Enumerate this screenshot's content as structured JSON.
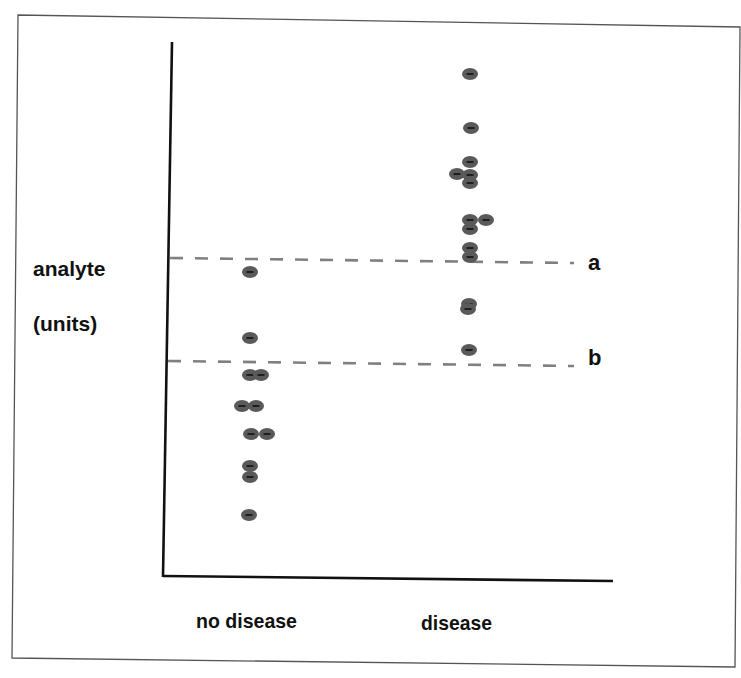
{
  "chart_data": {
    "type": "scatter",
    "title": "",
    "ylabel": [
      "analyte",
      "(units)"
    ],
    "xlabel": "",
    "categories": [
      "no disease",
      "disease"
    ],
    "series": [
      {
        "name": "no disease",
        "points": [
          {
            "x": 250,
            "y": 272
          },
          {
            "x": 250,
            "y": 338
          },
          {
            "x": 250,
            "y": 375
          },
          {
            "x": 261,
            "y": 375
          },
          {
            "x": 242,
            "y": 406
          },
          {
            "x": 256,
            "y": 406
          },
          {
            "x": 251,
            "y": 434
          },
          {
            "x": 267,
            "y": 434
          },
          {
            "x": 250,
            "y": 466
          },
          {
            "x": 250,
            "y": 477
          },
          {
            "x": 249,
            "y": 515
          }
        ]
      },
      {
        "name": "disease",
        "points": [
          {
            "x": 470,
            "y": 74
          },
          {
            "x": 471,
            "y": 128
          },
          {
            "x": 470,
            "y": 162
          },
          {
            "x": 457,
            "y": 174
          },
          {
            "x": 470,
            "y": 175
          },
          {
            "x": 470,
            "y": 183
          },
          {
            "x": 470,
            "y": 220
          },
          {
            "x": 486,
            "y": 220
          },
          {
            "x": 470,
            "y": 229
          },
          {
            "x": 470,
            "y": 248
          },
          {
            "x": 470,
            "y": 257
          },
          {
            "x": 469,
            "y": 304
          },
          {
            "x": 468,
            "y": 309
          },
          {
            "x": 469,
            "y": 350
          }
        ]
      }
    ],
    "thresholds": [
      {
        "label": "a",
        "y_start": 258,
        "y_end": 263
      },
      {
        "label": "b",
        "y_start": 361,
        "y_end": 366
      }
    ],
    "axis_ticks": "none",
    "grid": false,
    "legend": "none",
    "colors": {
      "dot": "#5a5a5a",
      "dot_center": "#111111",
      "dash": "#808080",
      "axis": "#111111",
      "frame": "#555555"
    }
  }
}
